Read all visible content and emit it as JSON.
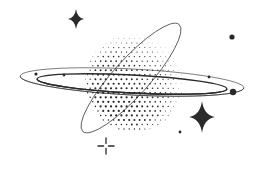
{
  "illustration": {
    "subject": "Halftone ringed planet with sparkles",
    "background": "#ffffff",
    "ink": "#2a2a2a",
    "planet": {
      "cx": 134,
      "cy": 83,
      "r": 49,
      "dot_spacing": 5.2
    },
    "rings": [
      {
        "cx": 132,
        "cy": 82,
        "rx": 112,
        "ry": 13,
        "rotate": 3,
        "stroke_width": 0.6
      },
      {
        "cx": 132,
        "cy": 84,
        "rx": 95,
        "ry": 9,
        "rotate": 3,
        "stroke_width": 1.4
      },
      {
        "cx": 131,
        "cy": 78,
        "rx": 72,
        "ry": 18,
        "rotate": -48,
        "stroke_width": 0.7
      }
    ],
    "ring_dots": [
      {
        "x": 36,
        "y": 74,
        "r": 1.6
      },
      {
        "x": 64,
        "y": 75,
        "r": 1.4
      },
      {
        "x": 209,
        "y": 77,
        "r": 1.4
      },
      {
        "x": 233,
        "y": 92,
        "r": 3.2
      }
    ],
    "free_dots": [
      {
        "x": 232,
        "y": 37,
        "r": 2.6
      },
      {
        "x": 180,
        "y": 132,
        "r": 1.4
      }
    ],
    "sparkles": [
      {
        "type": "star",
        "x": 76,
        "y": 19,
        "size": 10
      },
      {
        "type": "star",
        "x": 202,
        "y": 117,
        "size": 16
      },
      {
        "type": "cross-gap",
        "x": 106,
        "y": 146,
        "size": 8
      }
    ]
  }
}
